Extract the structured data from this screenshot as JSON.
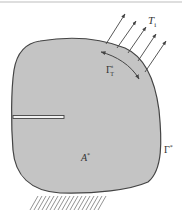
{
  "diagram": {
    "type": "solid-mechanics-domain",
    "colors": {
      "background": "#ffffff",
      "body_fill": "#c4c4c4",
      "outline": "#444444",
      "arrow": "#444444",
      "hatch": "#666666",
      "top_rule": "#bdbdbd"
    },
    "labels": {
      "traction": {
        "main": "T",
        "sub": "i"
      },
      "traction_boundary": {
        "main": "Γ",
        "sup": "t",
        "sub": "T"
      },
      "boundary": {
        "main": "Γ",
        "sup": "*"
      },
      "area": {
        "main": "A",
        "sup": "*"
      }
    },
    "elements": {
      "traction_arrows_count": 5,
      "crack": "horizontal crack from left boundary",
      "support": "hatched fixed support along bottom"
    }
  }
}
